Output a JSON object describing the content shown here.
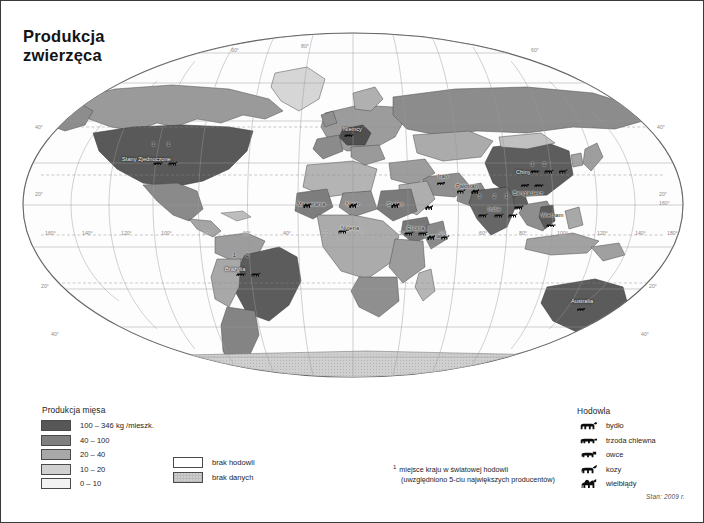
{
  "title": {
    "line1": "Produkcja",
    "line2": "zwierzęca"
  },
  "legend_meat": {
    "title": "Produkcja mięsa",
    "items": [
      {
        "label": "100 – 346 kg /mieszk.",
        "color": "#575757"
      },
      {
        "label": "40 – 100",
        "color": "#7f7f7f"
      },
      {
        "label": "20 – 40",
        "color": "#a8a8a8"
      },
      {
        "label": "10 – 20",
        "color": "#d0d0d0"
      },
      {
        "label": "0 – 10",
        "color": "#f2f2f2"
      }
    ]
  },
  "legend_extra": {
    "items": [
      {
        "label": "brak hodowli",
        "color": "#ffffff"
      },
      {
        "label": "brak danych",
        "color": "#c9c9c9"
      }
    ]
  },
  "legend_note": {
    "superscript": "1",
    "line1": "miejsce kraju w światowej hodowli",
    "line2": "(uwzględniono 5-ciu największych producentów)"
  },
  "legend_breed": {
    "title": "Hodowla",
    "items": [
      {
        "label": "bydło",
        "icon": "cattle-icon"
      },
      {
        "label": "trzoda chlewna",
        "icon": "pig-icon"
      },
      {
        "label": "owce",
        "icon": "sheep-icon"
      },
      {
        "label": "kozy",
        "icon": "goat-icon"
      },
      {
        "label": "wielbłądy",
        "icon": "camel-icon"
      }
    ]
  },
  "status": "Stan: 2009 r.",
  "map": {
    "country_labels": [
      {
        "name": "Stany Zjednoczone",
        "x": 121,
        "y": 155,
        "light": true
      },
      {
        "name": "Brazylia",
        "x": 224,
        "y": 265,
        "light": true
      },
      {
        "name": "Niemcy",
        "x": 342,
        "y": 125,
        "light": true
      },
      {
        "name": "Mauretania",
        "x": 296,
        "y": 200,
        "light": false
      },
      {
        "name": "Niger",
        "x": 345,
        "y": 200,
        "light": false
      },
      {
        "name": "Nigeria",
        "x": 340,
        "y": 224,
        "light": false
      },
      {
        "name": "Sudan",
        "x": 386,
        "y": 200,
        "light": false
      },
      {
        "name": "Etiopia",
        "x": 406,
        "y": 224,
        "light": false
      },
      {
        "name": "Somalia",
        "x": 424,
        "y": 232,
        "light": false
      },
      {
        "name": "Iran",
        "x": 437,
        "y": 172,
        "light": false
      },
      {
        "name": "Pakistan",
        "x": 455,
        "y": 182,
        "light": false
      },
      {
        "name": "Indie",
        "x": 487,
        "y": 205,
        "light": false
      },
      {
        "name": "Chiny",
        "x": 515,
        "y": 168,
        "light": true
      },
      {
        "name": "Bangladesz",
        "x": 512,
        "y": 189,
        "light": false
      },
      {
        "name": "Wietnam",
        "x": 540,
        "y": 211,
        "light": false
      },
      {
        "name": "Australia",
        "x": 570,
        "y": 297,
        "light": true
      }
    ],
    "rank_markers": [
      {
        "rank": "1",
        "x": 151,
        "y": 140
      },
      {
        "rank": "1",
        "x": 166,
        "y": 140
      },
      {
        "rank": "1",
        "x": 232,
        "y": 251
      },
      {
        "rank": "2",
        "x": 245,
        "y": 251
      },
      {
        "rank": "3",
        "x": 477,
        "y": 192
      },
      {
        "rank": "2",
        "x": 492,
        "y": 192
      },
      {
        "rank": "1",
        "x": 504,
        "y": 192
      },
      {
        "rank": "1",
        "x": 530,
        "y": 160
      },
      {
        "rank": "2",
        "x": 542,
        "y": 160
      }
    ],
    "graticule_labels": [
      {
        "text": "160°",
        "x": 44,
        "y": 229
      },
      {
        "text": "140°",
        "x": 81,
        "y": 229
      },
      {
        "text": "120°",
        "x": 120,
        "y": 229
      },
      {
        "text": "100°",
        "x": 160,
        "y": 229
      },
      {
        "text": "80°",
        "x": 202,
        "y": 229
      },
      {
        "text": "60°",
        "x": 242,
        "y": 229
      },
      {
        "text": "40°",
        "x": 282,
        "y": 229
      },
      {
        "text": "20°",
        "x": 322,
        "y": 229
      },
      {
        "text": "0°",
        "x": 360,
        "y": 229
      },
      {
        "text": "20°",
        "x": 398,
        "y": 229
      },
      {
        "text": "40°",
        "x": 438,
        "y": 229
      },
      {
        "text": "60°",
        "x": 478,
        "y": 229
      },
      {
        "text": "80°",
        "x": 518,
        "y": 229
      },
      {
        "text": "100°",
        "x": 556,
        "y": 229
      },
      {
        "text": "120°",
        "x": 596,
        "y": 229
      },
      {
        "text": "140°",
        "x": 634,
        "y": 229
      },
      {
        "text": "160°",
        "x": 658,
        "y": 199
      },
      {
        "text": "180°",
        "x": 666,
        "y": 229
      },
      {
        "text": "40°",
        "x": 34,
        "y": 123
      },
      {
        "text": "20°",
        "x": 34,
        "y": 190
      },
      {
        "text": "40°",
        "x": 656,
        "y": 123
      },
      {
        "text": "20°",
        "x": 658,
        "y": 190
      },
      {
        "text": "20°",
        "x": 648,
        "y": 282
      },
      {
        "text": "40°",
        "x": 640,
        "y": 330
      },
      {
        "text": "20°",
        "x": 40,
        "y": 282
      },
      {
        "text": "40°",
        "x": 50,
        "y": 330
      },
      {
        "text": "60°",
        "x": 230,
        "y": 46
      },
      {
        "text": "80°",
        "x": 300,
        "y": 42
      },
      {
        "text": "60°",
        "x": 530,
        "y": 46
      }
    ]
  }
}
